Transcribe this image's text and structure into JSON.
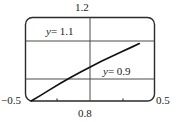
{
  "figure": {
    "title": "",
    "background_color": "#ffffff",
    "ink_color": "#1a1a1a",
    "grid_color": "#555555"
  },
  "labels": {
    "y_max": "1.2",
    "x_min": "−0.5",
    "x_max": "0.5",
    "x_mid": "0.8"
  },
  "annotations": {
    "upper": {
      "var": "y",
      "rest": "= 1.1"
    },
    "lower": {
      "var": "y",
      "rest": "= 0.9"
    }
  },
  "chart_data": {
    "type": "line",
    "title": "",
    "xlabel": "",
    "ylabel": "",
    "xlim": [
      -0.5,
      0.5
    ],
    "ylim": [
      0.8,
      1.2
    ],
    "grid": true,
    "legend": null,
    "x_ticks": [
      -0.5,
      -0.25,
      0,
      0.25,
      0.5
    ],
    "x_tick_labels": [
      "−0.5",
      "",
      "0.8",
      "",
      "0.5"
    ],
    "y_ticks": [
      0.8,
      0.9,
      1.1,
      1.2
    ],
    "y_tick_labels": [
      "",
      "",
      "",
      "1.2"
    ],
    "gridlines_horizontal": [
      0.9,
      1.1
    ],
    "gridlines_vertical": [
      0.0
    ],
    "annotations": [
      {
        "text": "y = 1.1",
        "x": -0.33,
        "y": 1.155
      },
      {
        "text": "y = 0.9",
        "x": 0.11,
        "y": 0.965
      }
    ],
    "series": [
      {
        "name": "curve",
        "x": [
          -0.475,
          -0.4,
          -0.32,
          -0.24,
          -0.16,
          -0.08,
          0.0,
          0.08,
          0.16,
          0.24,
          0.32,
          0.38
        ],
        "y": [
          0.8,
          0.827,
          0.857,
          0.886,
          0.914,
          0.94,
          0.965,
          0.99,
          1.013,
          1.036,
          1.058,
          1.075
        ]
      }
    ]
  }
}
